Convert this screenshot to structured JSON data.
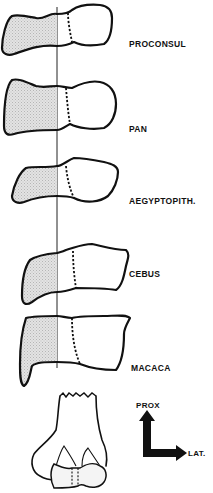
{
  "specimens": [
    {
      "id": "proconsul",
      "label": "PROCONSUL"
    },
    {
      "id": "pan",
      "label": "PAN"
    },
    {
      "id": "aegyptopith",
      "label": "AEGYPTOPITH."
    },
    {
      "id": "cebus",
      "label": "CEBUS"
    },
    {
      "id": "macaca",
      "label": "MACACA"
    }
  ],
  "orientation": {
    "proximal_label": "PROX",
    "lateral_label": "LAT."
  },
  "colors": {
    "stroke": "#111111",
    "shading": "#d9d9d9",
    "background": "#ffffff"
  }
}
